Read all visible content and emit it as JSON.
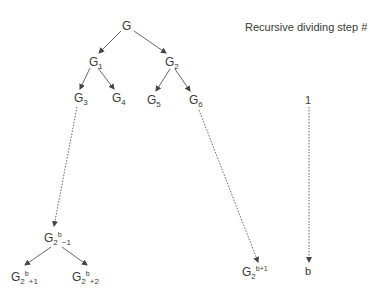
{
  "diagram": {
    "title": "Recursive dividing step #",
    "steps": {
      "first": "1",
      "last": "b"
    },
    "nodes": {
      "root": {
        "base": "G",
        "sub": ""
      },
      "g1": {
        "base": "G",
        "sub": "1"
      },
      "g2": {
        "base": "G",
        "sub": "2"
      },
      "g3": {
        "base": "G",
        "sub": "3"
      },
      "g4": {
        "base": "G",
        "sub": "4"
      },
      "g5": {
        "base": "G",
        "sub": "5"
      },
      "g6": {
        "base": "G",
        "sub": "6"
      },
      "g2b_minus1": {
        "base": "G",
        "sub": "2",
        "sup": "b",
        "tail": "−1"
      },
      "g2b_plus1": {
        "base": "G",
        "sub": "2",
        "sup": "b",
        "tail": "+1"
      },
      "g2b_plus2": {
        "base": "G",
        "sub": "2",
        "sup": "b",
        "tail": "+2"
      },
      "g2_bplus1": {
        "base": "G",
        "sub": "2",
        "sup": "b+1"
      }
    },
    "edges": [
      {
        "from": "G",
        "to": "G1",
        "style": "solid"
      },
      {
        "from": "G",
        "to": "G2",
        "style": "solid"
      },
      {
        "from": "G1",
        "to": "G3",
        "style": "solid"
      },
      {
        "from": "G1",
        "to": "G4",
        "style": "solid"
      },
      {
        "from": "G2",
        "to": "G5",
        "style": "solid"
      },
      {
        "from": "G2",
        "to": "G6",
        "style": "solid"
      },
      {
        "from": "G3",
        "to": "G2^b-1",
        "style": "dotted"
      },
      {
        "from": "G6",
        "to": "G2^(b+1)",
        "style": "dotted"
      },
      {
        "from": "G2^b-1",
        "to": "G2^b+1",
        "style": "solid"
      },
      {
        "from": "G2^b-1",
        "to": "G2^b+2",
        "style": "solid"
      },
      {
        "from": "1",
        "to": "b",
        "style": "dotted"
      }
    ],
    "colors": {
      "line": "#555555",
      "text": "#3a3a3a",
      "background": "#ffffff"
    }
  }
}
